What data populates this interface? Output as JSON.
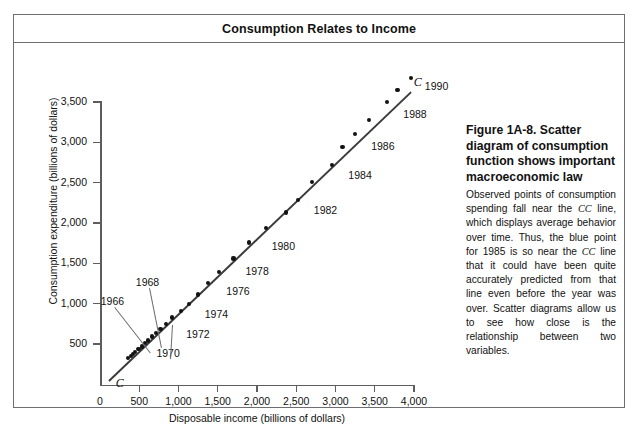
{
  "figure": {
    "title": "Consumption Relates to Income"
  },
  "caption": {
    "heading": "Figure 1A-8. Scatter diagram of consumption function shows important macroeconomic law",
    "body_part_1": "Observed points of consumption spending fall near the ",
    "cc_1": "CC",
    "body_part_2": " line, which displays average behavior over time. Thus, the blue point for 1985 is so near the ",
    "cc_2": "CC",
    "body_part_3": " line that it could have been quite accurately predicted from that line even before the year was over. Scatter diagrams allow us to see how close is the relationship between two variables."
  },
  "chart_data": {
    "type": "scatter",
    "title": "Consumption Relates to Income",
    "xlabel": "Disposable income (billions of dollars)",
    "ylabel": "Consumption expenditure (billions of dollars)",
    "xlim": [
      0,
      4000
    ],
    "ylim": [
      0,
      3500
    ],
    "xticks": [
      0,
      500,
      1000,
      1500,
      2000,
      2500,
      3000,
      3500,
      4000
    ],
    "xticklabels": [
      "0",
      "500",
      "1,000",
      "1,500",
      "2,000",
      "2,500",
      "3,000",
      "3,500",
      "4,000"
    ],
    "yticks": [
      500,
      1000,
      1500,
      2000,
      2500,
      3000,
      3500
    ],
    "yticklabels": [
      "500",
      "1,000",
      "1,500",
      "2,000",
      "2,500",
      "3,000",
      "3,500"
    ],
    "grid": false,
    "legend": false,
    "line_label": "C",
    "line_label_start": "C",
    "line_label_end": "C",
    "trend_line": {
      "name": "CC line",
      "x_start": 110,
      "y_start": 60,
      "x_end": 3960,
      "y_end": 3640
    },
    "points": [
      {
        "year": 1960,
        "x": 360,
        "y": 330
      },
      {
        "year": 1961,
        "x": 390,
        "y": 350
      },
      {
        "year": 1962,
        "x": 420,
        "y": 380
      },
      {
        "year": 1963,
        "x": 450,
        "y": 400
      },
      {
        "year": 1964,
        "x": 490,
        "y": 435
      },
      {
        "year": 1965,
        "x": 530,
        "y": 470
      },
      {
        "year": 1966,
        "x": 570,
        "y": 510
      },
      {
        "year": 1967,
        "x": 610,
        "y": 545
      },
      {
        "year": 1968,
        "x": 660,
        "y": 595
      },
      {
        "year": 1969,
        "x": 710,
        "y": 640
      },
      {
        "year": 1970,
        "x": 770,
        "y": 690
      },
      {
        "year": 1971,
        "x": 840,
        "y": 750
      },
      {
        "year": 1972,
        "x": 920,
        "y": 830
      },
      {
        "year": 1973,
        "x": 1030,
        "y": 910
      },
      {
        "year": 1974,
        "x": 1130,
        "y": 1000
      },
      {
        "year": 1975,
        "x": 1250,
        "y": 1115
      },
      {
        "year": 1976,
        "x": 1380,
        "y": 1255
      },
      {
        "year": 1977,
        "x": 1520,
        "y": 1395
      },
      {
        "year": 1978,
        "x": 1700,
        "y": 1560
      },
      {
        "year": 1979,
        "x": 1900,
        "y": 1760
      },
      {
        "year": 1980,
        "x": 2110,
        "y": 1940
      },
      {
        "year": 1981,
        "x": 2370,
        "y": 2130
      },
      {
        "year": 1982,
        "x": 2520,
        "y": 2290
      },
      {
        "year": 1983,
        "x": 2700,
        "y": 2510
      },
      {
        "year": 1984,
        "x": 2960,
        "y": 2720
      },
      {
        "year": 1985,
        "x": 3090,
        "y": 2940
      },
      {
        "year": 1986,
        "x": 3250,
        "y": 3100
      },
      {
        "year": 1987,
        "x": 3430,
        "y": 3280
      },
      {
        "year": 1988,
        "x": 3660,
        "y": 3500
      },
      {
        "year": 1989,
        "x": 3790,
        "y": 3650
      },
      {
        "year": 1990,
        "x": 3960,
        "y": 3800
      }
    ],
    "annotations": [
      {
        "label": "1966",
        "x": 570,
        "y": 510
      },
      {
        "label": "1968",
        "x": 660,
        "y": 595
      },
      {
        "label": "1970",
        "x": 770,
        "y": 690
      },
      {
        "label": "1972",
        "x": 920,
        "y": 830
      },
      {
        "label": "1974",
        "x": 1130,
        "y": 1000
      },
      {
        "label": "1976",
        "x": 1380,
        "y": 1255
      },
      {
        "label": "1978",
        "x": 1700,
        "y": 1560
      },
      {
        "label": "1980",
        "x": 2110,
        "y": 1940
      },
      {
        "label": "1982",
        "x": 2520,
        "y": 2290
      },
      {
        "label": "1984",
        "x": 2960,
        "y": 2720
      },
      {
        "label": "1986",
        "x": 3250,
        "y": 3100
      },
      {
        "label": "1988",
        "x": 3660,
        "y": 3500
      },
      {
        "label": "1990",
        "x": 3960,
        "y": 3800
      }
    ]
  },
  "colors": {
    "frame": "#6e6e72",
    "axis": "#5d5d61",
    "point": "#121212",
    "line": "#3b3b3f",
    "text": "#111111"
  }
}
